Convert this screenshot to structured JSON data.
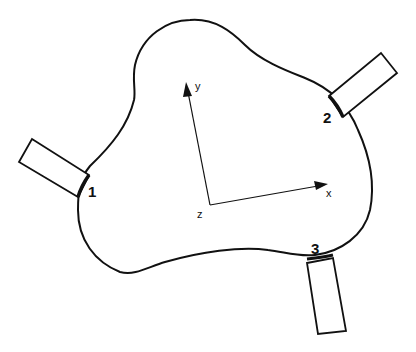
{
  "diagram": {
    "type": "multiport-device-outline",
    "stroke_color": "#111111",
    "background": "#ffffff",
    "ports": [
      {
        "label": "1",
        "position": "left"
      },
      {
        "label": "2",
        "position": "upper-right"
      },
      {
        "label": "3",
        "position": "bottom"
      }
    ],
    "axes": {
      "x_label": "x",
      "y_label": "y",
      "z_label": "z"
    }
  }
}
